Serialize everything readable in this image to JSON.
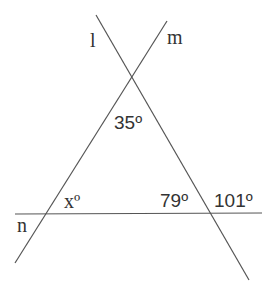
{
  "diagram": {
    "lines": [
      {
        "name": "l",
        "label": "l",
        "x1": 96,
        "y1": 15,
        "x2": 249,
        "y2": 280
      },
      {
        "name": "m",
        "label": "m",
        "x1": 167,
        "y1": 21,
        "x2": 15,
        "y2": 263
      },
      {
        "name": "n",
        "label": "n",
        "x1": 15,
        "y1": 214,
        "x2": 262,
        "y2": 213
      }
    ],
    "labels": {
      "line_l": "l",
      "line_m": "m",
      "line_n": "n",
      "angle_top": "35º",
      "angle_x": "xº",
      "angle_79": "79º",
      "angle_101": "101º"
    },
    "stroke_color": "#555555",
    "text_color": "#333333"
  }
}
